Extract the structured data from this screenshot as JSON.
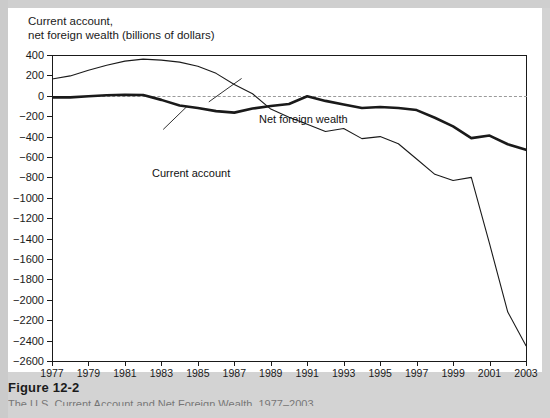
{
  "figure": {
    "caption_title": "Figure 12-2",
    "caption_body": "The U.S. Current Account and Net Foreign Wealth, 1977–2003"
  },
  "chart_data": {
    "type": "line",
    "title": "Current account,\nnet foreign wealth (billions of dollars)",
    "xlabel": "",
    "ylabel": "billions of dollars",
    "xlim": [
      1977,
      2003
    ],
    "ylim": [
      -2600,
      400
    ],
    "ytick_step": 200,
    "grid": false,
    "zero_line": true,
    "zero_line_style": "dashed",
    "legend": "inline-annotations",
    "yticks": [
      400,
      200,
      0,
      -200,
      -400,
      -600,
      -800,
      -1000,
      -1200,
      -1400,
      -1600,
      -1800,
      -2000,
      -2200,
      -2400,
      -2600
    ],
    "ytick_labels": [
      "400",
      "200",
      "0",
      "−200",
      "−400",
      "−600",
      "−800",
      "−1000",
      "−1200",
      "−1400",
      "−1600",
      "−1800",
      "−2000",
      "−2200",
      "−2400",
      "−2600"
    ],
    "xticks": [
      1977,
      1979,
      1981,
      1983,
      1985,
      1987,
      1989,
      1991,
      1993,
      1995,
      1997,
      1999,
      2001,
      2003
    ],
    "xtick_labels": [
      "1977",
      "1979",
      "1981",
      "1983",
      "1985",
      "1987",
      "1989",
      "1991",
      "1993",
      "1995",
      "1997",
      "1999",
      "2001",
      "2003"
    ],
    "x": [
      1977,
      1978,
      1979,
      1980,
      1981,
      1982,
      1983,
      1984,
      1985,
      1986,
      1987,
      1988,
      1989,
      1990,
      1991,
      1992,
      1993,
      1994,
      1995,
      1996,
      1997,
      1998,
      1999,
      2000,
      2001,
      2002,
      2003
    ],
    "series": [
      {
        "name": "Net foreign wealth",
        "label": "Net foreign wealth",
        "style": "thin",
        "color": "#1a1a1a",
        "values": [
          165,
          195,
          250,
          300,
          340,
          360,
          350,
          330,
          290,
          220,
          110,
          20,
          -130,
          -210,
          -280,
          -350,
          -320,
          -420,
          -400,
          -470,
          -620,
          -770,
          -830,
          -800,
          -1450,
          -2120,
          -2450
        ]
      },
      {
        "name": "Current account",
        "label": "Current account",
        "style": "thick",
        "color": "#1a1a1a",
        "values": [
          -15,
          -15,
          -5,
          5,
          10,
          8,
          -40,
          -95,
          -120,
          -150,
          -165,
          -125,
          -100,
          -80,
          -5,
          -50,
          -85,
          -120,
          -110,
          -120,
          -140,
          -215,
          -300,
          -415,
          -390,
          -475,
          -530
        ]
      }
    ],
    "annotations": [
      {
        "text": "Net foreign wealth",
        "x": 1987.8,
        "y": 230
      },
      {
        "text": "Current account",
        "x": 1980.0,
        "y": -320
      }
    ]
  }
}
